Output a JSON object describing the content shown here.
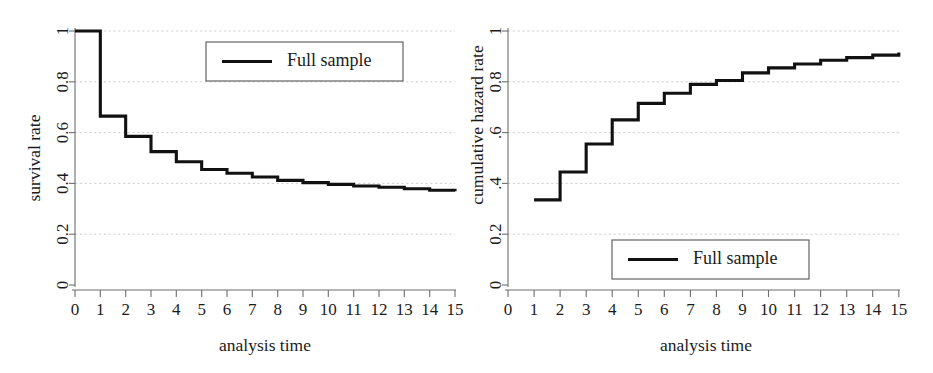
{
  "figure": {
    "panels": [
      "left",
      "right"
    ],
    "line_color": "#111111",
    "grid_color": "#c9c9c9",
    "axis_color": "#6e6e6e"
  },
  "left": {
    "legend_label": "Full sample",
    "ylabel": "survival rate",
    "xlabel": "analysis time",
    "yticks": [
      "0",
      "0.2",
      "0.4",
      "0.6",
      "0.8",
      "1"
    ],
    "xticks": [
      "0",
      "1",
      "2",
      "3",
      "4",
      "5",
      "6",
      "7",
      "8",
      "9",
      "10",
      "11",
      "12",
      "13",
      "14",
      "15"
    ]
  },
  "right": {
    "legend_label": "Full sample",
    "ylabel": "cumulative hazard rate",
    "xlabel": "analysis time",
    "yticks": [
      "0",
      "0.2",
      ".4",
      ".6",
      "0.8",
      "1"
    ],
    "xticks": [
      "0",
      "1",
      "2",
      "3",
      "4",
      "5",
      "6",
      "7",
      "8",
      "9",
      "10",
      "11",
      "12",
      "13",
      "14",
      "15"
    ]
  },
  "chart_data": [
    {
      "type": "line",
      "id": "survival-function",
      "title": "",
      "subtitle": "",
      "xlabel": "analysis time",
      "ylabel": "survival rate",
      "xlim": [
        0,
        15
      ],
      "ylim": [
        0,
        1
      ],
      "xticks": [
        0,
        1,
        2,
        3,
        4,
        5,
        6,
        7,
        8,
        9,
        10,
        11,
        12,
        13,
        14,
        15
      ],
      "yticks": [
        0,
        0.2,
        0.4,
        0.6,
        0.8,
        1
      ],
      "grid": "horizontal-dashed",
      "step": "post",
      "legend": {
        "position": "top-right-inside",
        "entries": [
          "Full sample"
        ]
      },
      "series": [
        {
          "name": "Full sample",
          "color": "#111111",
          "x": [
            0,
            1,
            2,
            3,
            4,
            5,
            6,
            7,
            8,
            9,
            10,
            11,
            12,
            13,
            14,
            15
          ],
          "values": [
            1.0,
            0.665,
            0.585,
            0.525,
            0.485,
            0.455,
            0.44,
            0.425,
            0.412,
            0.403,
            0.396,
            0.39,
            0.385,
            0.379,
            0.373,
            0.369
          ]
        }
      ]
    },
    {
      "type": "line",
      "id": "cumulative-hazard-function",
      "title": "",
      "subtitle": "",
      "xlabel": "analysis time",
      "ylabel": "cumulative hazard rate",
      "xlim": [
        0,
        15
      ],
      "ylim": [
        0,
        1
      ],
      "xticks": [
        0,
        1,
        2,
        3,
        4,
        5,
        6,
        7,
        8,
        9,
        10,
        11,
        12,
        13,
        14,
        15
      ],
      "yticks": [
        0,
        0.2,
        0.4,
        0.6,
        0.8,
        1
      ],
      "grid": "horizontal-dashed",
      "step": "post",
      "legend": {
        "position": "bottom-center-inside",
        "entries": [
          "Full sample"
        ]
      },
      "series": [
        {
          "name": "Full sample",
          "color": "#111111",
          "x": [
            1,
            2,
            3,
            4,
            5,
            6,
            7,
            8,
            9,
            10,
            11,
            12,
            13,
            14,
            15
          ],
          "values": [
            0.335,
            0.445,
            0.555,
            0.65,
            0.715,
            0.755,
            0.79,
            0.805,
            0.835,
            0.855,
            0.87,
            0.885,
            0.895,
            0.905,
            0.915
          ]
        }
      ]
    }
  ]
}
